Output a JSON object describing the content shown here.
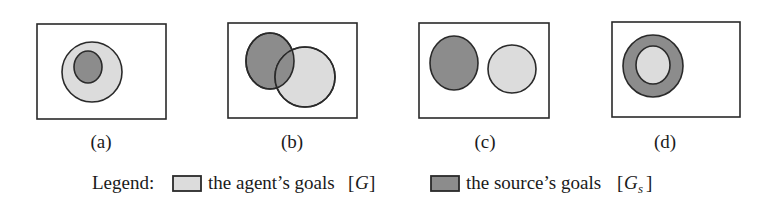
{
  "figure": {
    "colors": {
      "agent_goals_fill": "#dcdcdc",
      "source_goals_fill": "#8c8c8c",
      "outline": "#2a2a2a",
      "frame_fill": "#ffffff"
    },
    "panels": [
      {
        "id": "a",
        "caption": "(a)",
        "relation": "source goals contained within agent goals"
      },
      {
        "id": "b",
        "caption": "(b)",
        "relation": "source goals partially overlap agent goals"
      },
      {
        "id": "c",
        "caption": "(c)",
        "relation": "source goals disjoint from agent goals"
      },
      {
        "id": "d",
        "caption": "(d)",
        "relation": "agent goals contained within source goals"
      }
    ],
    "legend": {
      "prefix": "Legend:",
      "items": [
        {
          "key": "agent",
          "label": "the agent’s goals",
          "symbol_open": "[",
          "symbol": "G",
          "symbol_sub": "",
          "symbol_close": "]"
        },
        {
          "key": "source",
          "label": "the source’s goals",
          "symbol_open": "[",
          "symbol": "G",
          "symbol_sub": "s",
          "symbol_close": "]"
        }
      ]
    }
  }
}
